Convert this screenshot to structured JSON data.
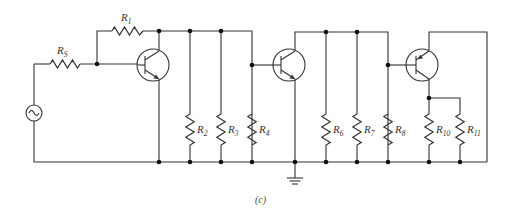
{
  "figure": {
    "caption": "(c)"
  },
  "components": {
    "source": {
      "type": "ac-voltage-source",
      "label": ""
    },
    "transistors": [
      {
        "id": "Q1",
        "type": "npn"
      },
      {
        "id": "Q2",
        "type": "npn"
      },
      {
        "id": "Q3",
        "type": "pnp"
      }
    ],
    "resistors": [
      {
        "id": "Rs",
        "base": "R",
        "sub": "S"
      },
      {
        "id": "R1",
        "base": "R",
        "sub": "1"
      },
      {
        "id": "R2",
        "base": "R",
        "sub": "2"
      },
      {
        "id": "R3",
        "base": "R",
        "sub": "3"
      },
      {
        "id": "R4",
        "base": "R",
        "sub": "4"
      },
      {
        "id": "R6",
        "base": "R",
        "sub": "6"
      },
      {
        "id": "R7",
        "base": "R",
        "sub": "7"
      },
      {
        "id": "R8",
        "base": "R",
        "sub": "8"
      },
      {
        "id": "R10",
        "base": "R",
        "sub": "10"
      },
      {
        "id": "R11",
        "base": "R",
        "sub": "11"
      }
    ],
    "ground": {
      "type": "ground-symbol"
    }
  },
  "colors": {
    "ink": "#333333",
    "background": "#ffffff"
  }
}
